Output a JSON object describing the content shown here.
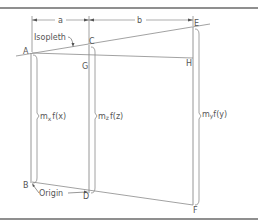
{
  "diagram": {
    "type": "nomograph",
    "colors": {
      "line": "#8a8a8a",
      "frame": "#6a6a6a",
      "text": "#555555",
      "background": "#ffffff"
    },
    "dimensions": {
      "a_label": "a",
      "b_label": "b"
    },
    "points": {
      "A": "A",
      "B": "B",
      "C": "C",
      "D": "D",
      "E": "E",
      "F": "F",
      "G": "G",
      "H": "H"
    },
    "annotations": {
      "isopleth": "Isopleth",
      "origin": "Origin"
    },
    "scales": {
      "x": {
        "prefix": "m",
        "sub": "x",
        "suffix": "f(x)"
      },
      "z": {
        "prefix": "m",
        "sub": "z",
        "suffix": "f(z)"
      },
      "y": {
        "prefix": "m",
        "sub": "y",
        "suffix": "f(y)"
      }
    }
  }
}
